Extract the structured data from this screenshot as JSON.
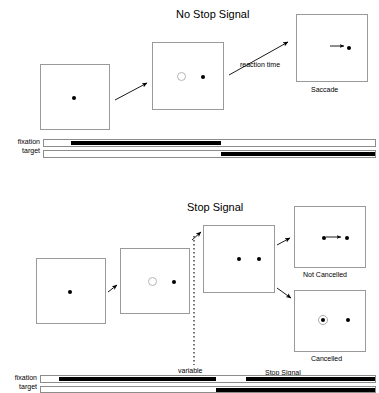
{
  "figure": {
    "title_top": "No Stop Signal",
    "title_bottom": "Stop Signal"
  },
  "panels": [
    {
      "id": "no-stop-signal",
      "title": "No Stop Signal",
      "frames": [
        {
          "id": "fixation-only",
          "caption": "",
          "contents": [
            "fixation-dot"
          ]
        },
        {
          "id": "target-onset",
          "caption": "",
          "contents": [
            "fixation-dimmed-ring",
            "target-dot"
          ]
        },
        {
          "id": "saccade",
          "caption": "Saccade",
          "contents": [
            "saccade-arrow",
            "target-dot"
          ]
        }
      ],
      "arrow_labels": [
        "reaction time"
      ],
      "timeline": {
        "rows": [
          {
            "label": "fixation"
          },
          {
            "label": "target"
          }
        ],
        "annotations": []
      }
    },
    {
      "id": "stop-signal",
      "title": "Stop Signal",
      "frames": [
        {
          "id": "fixation-only",
          "caption": "",
          "contents": [
            "fixation-dot"
          ]
        },
        {
          "id": "target-onset",
          "caption": "",
          "contents": [
            "fixation-dimmed-ring",
            "target-dot"
          ]
        },
        {
          "id": "stop-signal-onset",
          "caption": "",
          "contents": [
            "fixation-dot",
            "target-dot"
          ]
        },
        {
          "id": "not-cancelled",
          "caption": "Not Cancelled",
          "contents": [
            "fixation-dot",
            "saccade-arrow",
            "target-dot"
          ]
        },
        {
          "id": "cancelled",
          "caption": "Cancelled",
          "contents": [
            "fixation-dot-ringed",
            "target-dot"
          ]
        }
      ],
      "arrow_labels": [],
      "timeline": {
        "rows": [
          {
            "label": "fixation"
          },
          {
            "label": "target"
          }
        ],
        "annotations": [
          {
            "id": "variable-delay",
            "text": "variable"
          },
          {
            "id": "stop-signal-period",
            "text": "Stop Signal"
          }
        ]
      }
    }
  ],
  "labels": {
    "reaction_time": "reaction time",
    "saccade": "Saccade",
    "not_cancelled": "Not Cancelled",
    "cancelled": "Cancelled",
    "variable": "variable",
    "stop_signal": "Stop Signal",
    "fixation_top": "fixation",
    "target_top": "target",
    "fixation_bottom": "fixation",
    "target_bottom": "target"
  },
  "colors": {
    "frame_border": "#9a9a9a",
    "dot": "#000000",
    "ring": "#b6b6b6",
    "bar_on": "#000000",
    "bar_off": "#ffffff",
    "bar_border": "#8c8c8c",
    "text": "#000000"
  }
}
